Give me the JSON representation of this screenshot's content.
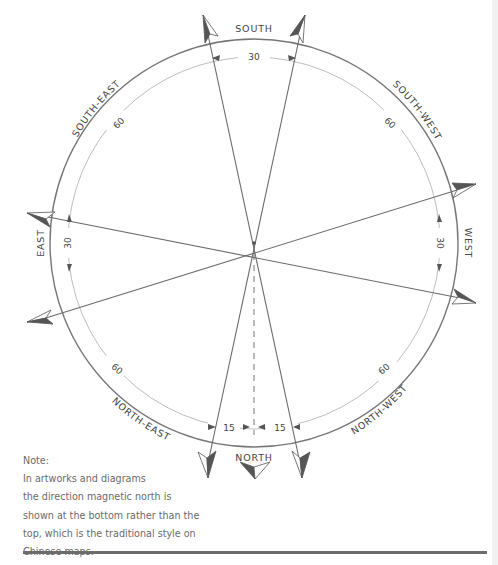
{
  "diagram": {
    "directions": {
      "south": "SOUTH",
      "south_east": "SOUTH-EAST",
      "south_west": "SOUTH-WEST",
      "east": "EAST",
      "west": "WEST",
      "north_east": "NORTH-EAST",
      "north_west": "NORTH-WEST",
      "north": "NORTH"
    },
    "angles": {
      "south": "30",
      "south_east": "60",
      "south_west": "60",
      "east": "30",
      "west": "30",
      "north_east": "60",
      "north_west": "60",
      "north_left": "15",
      "north_right": "15"
    },
    "colors": {
      "line": "#6b6b6b",
      "circle": "#777777",
      "inner_arc": "#aaaaaa",
      "arrow_fill": "#555555",
      "text": "#444444"
    }
  },
  "note": {
    "heading": "Note:",
    "lines": [
      "In artworks and diagrams",
      "the direction magnetic north is",
      "shown at the bottom rather than the",
      "top, which is the traditional style on",
      "Chinese maps."
    ]
  }
}
